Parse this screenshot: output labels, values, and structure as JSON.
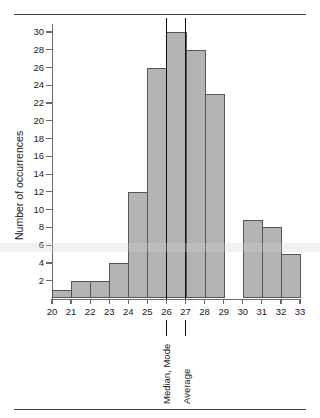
{
  "chart_data": {
    "type": "bar",
    "title": "",
    "xlabel": "",
    "ylabel": "Number of occurrences",
    "categories": [
      "20",
      "21",
      "22",
      "23",
      "24",
      "25",
      "26",
      "27",
      "28",
      "29",
      "30",
      "31",
      "32"
    ],
    "values": [
      1,
      2,
      2,
      4,
      12,
      26,
      30,
      28,
      23,
      0,
      8.8,
      8,
      5
    ],
    "xlim": [
      20,
      33
    ],
    "ylim": [
      0,
      30
    ],
    "x_tick_labels": [
      "20",
      "21",
      "22",
      "23",
      "24",
      "25",
      "26",
      "27",
      "28",
      "29",
      "30",
      "31",
      "32",
      "33"
    ],
    "y_tick_labels": [
      "2",
      "4",
      "6",
      "8",
      "10",
      "12",
      "14",
      "16",
      "18",
      "20",
      "22",
      "24",
      "26",
      "28",
      "30"
    ],
    "y_tick_values": [
      2,
      4,
      6,
      8,
      10,
      12,
      14,
      16,
      18,
      20,
      22,
      24,
      26,
      28,
      30
    ],
    "grid": false,
    "legend": null,
    "bar_fill_color": "#b4b4b4",
    "bar_edge_color": "#555555",
    "annotations": [
      {
        "label": "Median, Mode",
        "x": 26,
        "type": "vertical-line",
        "color": "#111111"
      },
      {
        "label": "Average",
        "x": 27,
        "type": "vertical-line",
        "color": "#111111"
      }
    ]
  },
  "figure": {
    "background_color": "#ffffff",
    "rule_color": "#3a3a3a"
  }
}
